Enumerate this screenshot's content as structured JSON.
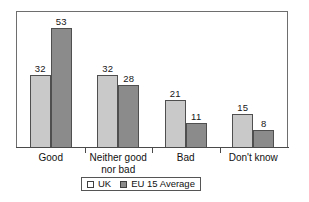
{
  "chart_data": {
    "type": "bar",
    "title": "",
    "subtitle": "",
    "xlabel": "",
    "ylabel": "",
    "ylim": [
      0,
      60
    ],
    "grid": false,
    "legend_position": "bottom",
    "categories": [
      "Good",
      "Neither good nor bad",
      "Bad",
      "Don't know"
    ],
    "category_lines": [
      {
        "line1": "Good",
        "line2": ""
      },
      {
        "line1": "Neither good",
        "line2": "nor bad"
      },
      {
        "line1": "Bad",
        "line2": ""
      },
      {
        "line1": "Don't know",
        "line2": ""
      }
    ],
    "series": [
      {
        "name": "UK",
        "color": "#c9c9c9",
        "values": [
          32,
          32,
          21,
          15
        ]
      },
      {
        "name": "EU 15 Average",
        "color": "#8b8b8b",
        "values": [
          53,
          28,
          11,
          8
        ]
      }
    ]
  },
  "legend": {
    "items": [
      {
        "label": "UK"
      },
      {
        "label": "EU 15 Average"
      }
    ]
  },
  "colors": {
    "series_uk": "#c9c9c9",
    "series_eu": "#8b8b8b",
    "frame": "#6e6e6e",
    "axis": "#4a4a4a",
    "text": "#111111",
    "background": "#ffffff"
  }
}
